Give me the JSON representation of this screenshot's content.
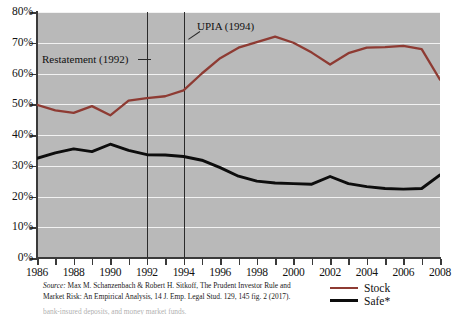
{
  "chart_data": {
    "type": "line",
    "title": "",
    "xlabel": "",
    "ylabel": "",
    "xlim": [
      1986,
      2008
    ],
    "ylim": [
      0,
      80
    ],
    "grid": true,
    "legend_position": "bottom-right",
    "y_tick_labels": [
      "0%",
      "10%",
      "20%",
      "30%",
      "40%",
      "50%",
      "60%",
      "70%",
      "80%"
    ],
    "y_tick_values": [
      0,
      10,
      20,
      30,
      40,
      50,
      60,
      70,
      80
    ],
    "x_tick_values": [
      1986,
      1987,
      1988,
      1989,
      1990,
      1991,
      1992,
      1993,
      1994,
      1995,
      1996,
      1997,
      1998,
      1999,
      2000,
      2001,
      2002,
      2003,
      2004,
      2005,
      2006,
      2007,
      2008
    ],
    "x_tick_labels": [
      "1986",
      "",
      "1988",
      "",
      "1990",
      "",
      "1992",
      "",
      "1994",
      "",
      "1996",
      "",
      "1998",
      "",
      "2000",
      "",
      "2002",
      "",
      "2004",
      "",
      "2006",
      "",
      "2008"
    ],
    "x": [
      1986,
      1987,
      1988,
      1989,
      1990,
      1991,
      1992,
      1993,
      1994,
      1995,
      1996,
      1997,
      1998,
      1999,
      2000,
      2001,
      2002,
      2003,
      2004,
      2005,
      2006,
      2007,
      2008
    ],
    "series": [
      {
        "name": "Stock",
        "color": "#8e3b33",
        "values": [
          49.8,
          48.0,
          47.2,
          49.4,
          46.4,
          51.2,
          52.0,
          52.6,
          54.5,
          60.0,
          65.0,
          68.4,
          70.2,
          72.0,
          70.0,
          66.8,
          62.9,
          66.6,
          68.4,
          68.6,
          69.0,
          67.9,
          58.0
        ]
      },
      {
        "name": "Safe*",
        "color": "#0d0d0d",
        "values": [
          32.4,
          34.2,
          35.5,
          34.6,
          37.0,
          35.0,
          33.6,
          33.5,
          33.0,
          31.8,
          29.4,
          26.6,
          25.0,
          24.4,
          24.2,
          24.0,
          26.5,
          24.2,
          23.2,
          22.6,
          22.4,
          22.6,
          27.0
        ]
      }
    ],
    "annotations": [
      {
        "label": "Restatement (1992)",
        "year": 1992
      },
      {
        "label": "UPIA (1994)",
        "year": 1994
      }
    ]
  },
  "legend": {
    "items": [
      {
        "label": "Stock",
        "color": "#8e3b33"
      },
      {
        "label": "Safe*",
        "color": "#0d0d0d"
      }
    ]
  },
  "source_note": {
    "source_word": "Source:",
    "line1": " Max M. Schanzenbach & Robert H. Sitkoff, The Prudent Investor Rule and",
    "line2": "Market Risk: An Empirical Analysis, 14 J. Emp. Legal Stud. 129, 145 fig. 2 (2017)."
  },
  "footnote": {
    "text": "bank-insured deposits, and money market funds."
  }
}
